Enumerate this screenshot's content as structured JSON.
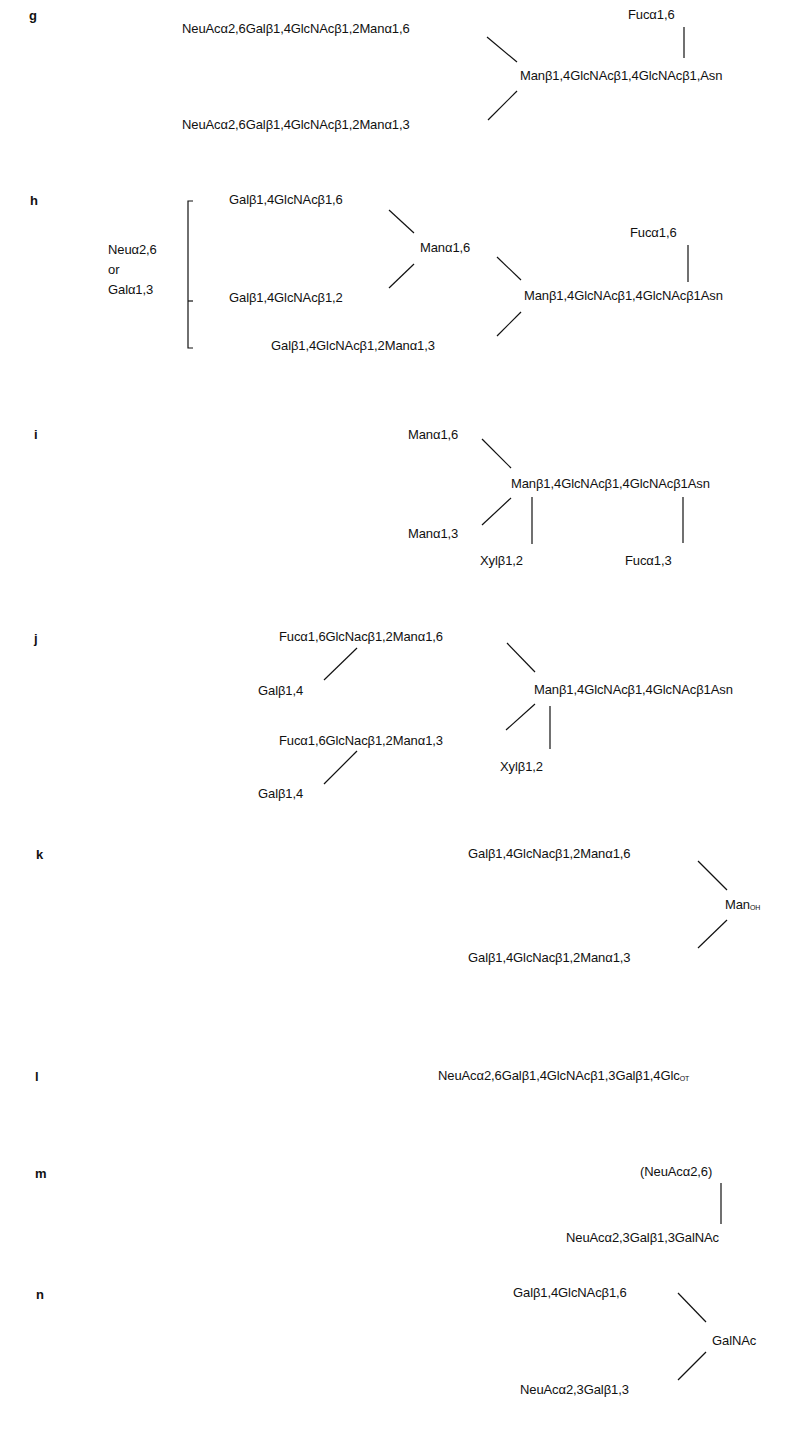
{
  "structures": {
    "g": {
      "label": "g",
      "branch_top": "NeuAcα2,6Galβ1,4GlcNAcβ1,2Manα1,6",
      "branch_bottom": "NeuAcα2,6Galβ1,4GlcNAcβ1,2Manα1,3",
      "core": "Manβ1,4GlcNAcβ1,4GlcNAcβ1,Asn",
      "core_substituent": "Fucα1,6"
    },
    "h": {
      "label": "h",
      "bracket_note_line1": "Neuα2,6",
      "bracket_note_line2": "or",
      "bracket_note_line3": "Galα1,3",
      "antenna_1": "Galβ1,4GlcNAcβ1,6",
      "antenna_2": "Galβ1,4GlcNAcβ1,2",
      "mid_branch": "Manα1,6",
      "antenna_3": "Galβ1,4GlcNAcβ1,2Manα1,3",
      "core": "Manβ1,4GlcNAcβ1,4GlcNAcβ1Asn",
      "core_substituent": "Fucα1,6"
    },
    "i": {
      "label": "i",
      "branch_top": "Manα1,6",
      "branch_bottom": "Manα1,3",
      "core": "Manβ1,4GlcNAcβ1,4GlcNAcβ1Asn",
      "xyl_substituent": "Xylβ1,2",
      "fuc_substituent": "Fucα1,3"
    },
    "j": {
      "label": "j",
      "branch_top": "Fucα1,6GlcNacβ1,2Manα1,6",
      "branch_top_gal": "Galβ1,4",
      "branch_bottom": "Fucα1,6GlcNacβ1,2Manα1,3",
      "branch_bottom_gal": "Galβ1,4",
      "core": "Manβ1,4GlcNAcβ1,4GlcNAcβ1Asn",
      "xyl_substituent": "Xylβ1,2"
    },
    "k": {
      "label": "k",
      "branch_top": "Galβ1,4GlcNacβ1,2Manα1,6",
      "branch_bottom": "Galβ1,4GlcNacβ1,2Manα1,3",
      "core_main": "Man",
      "core_subscript": "OH"
    },
    "l": {
      "label": "l",
      "chain_main": "NeuAcα2,6Galβ1,4GlcNAcβ1,3Galβ1,4Glc",
      "chain_subscript": "OT"
    },
    "m": {
      "label": "m",
      "substituent": "(NeuAcα2,6)",
      "chain": "NeuAcα2,3Galβ1,3GalNAc"
    },
    "n": {
      "label": "n",
      "branch_top": "Galβ1,4GlcNAcβ1,6",
      "branch_bottom": "NeuAcα2,3Galβ1,3",
      "core": "GalNAc"
    }
  }
}
